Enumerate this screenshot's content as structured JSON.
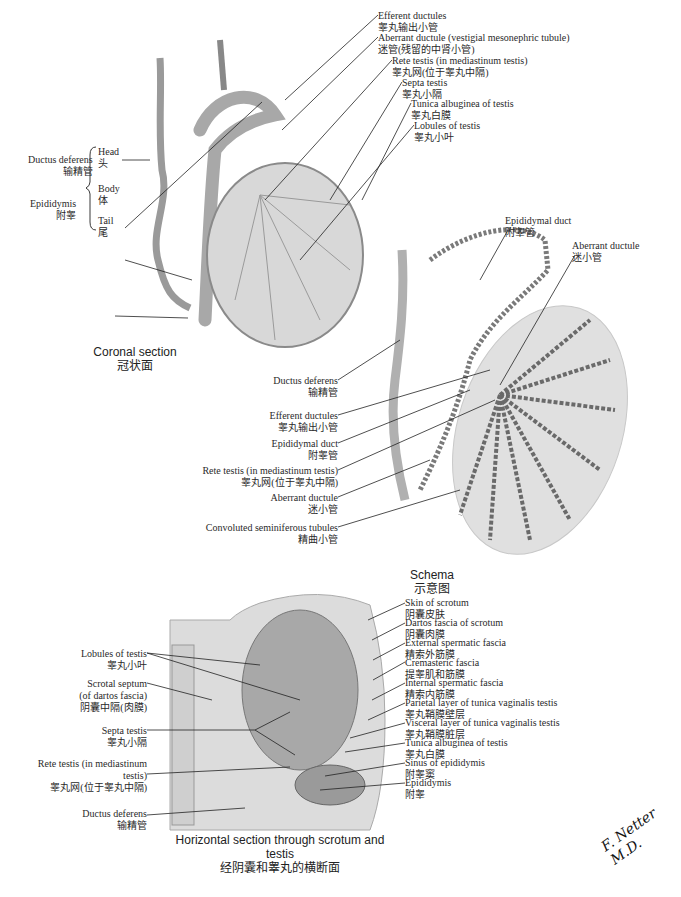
{
  "coronal": {
    "caption_en": "Coronal section",
    "caption_zh": "冠状面",
    "labels": {
      "ductus_deferens": {
        "en": "Ductus deferens",
        "zh": "输精管"
      },
      "epididymis": {
        "en": "Epididymis",
        "zh": "附睾"
      },
      "head": {
        "en": "Head",
        "zh": "头"
      },
      "body": {
        "en": "Body",
        "zh": "体"
      },
      "tail": {
        "en": "Tail",
        "zh": "尾"
      },
      "efferent_ductules": {
        "en": "Efferent ductules",
        "zh": "睾丸输出小管"
      },
      "aberrant_ductule": {
        "en": "Aberrant ductule (vestigial mesonephric tubule)",
        "zh": "迷管(残留的中肾小管)"
      },
      "rete_testis": {
        "en": "Rete testis (in mediastinum testis)",
        "zh": "睾丸网(位于睾丸中隔)"
      },
      "septa_testis": {
        "en": "Septa testis",
        "zh": "睾丸小隔"
      },
      "tunica_albuginea": {
        "en": "Tunica albuginea of testis",
        "zh": "睾丸白膜"
      },
      "lobules": {
        "en": "Lobules of testis",
        "zh": "睾丸小叶"
      }
    }
  },
  "schema": {
    "caption_en": "Schema",
    "caption_zh": "示意图",
    "labels": {
      "epididymal_duct_top": {
        "en": "Epididymal duct",
        "zh": "附睾管"
      },
      "aberrant_ductule_top": {
        "en": "Aberrant ductule",
        "zh": "迷小管"
      },
      "ductus_deferens": {
        "en": "Ductus deferens",
        "zh": "输精管"
      },
      "efferent_ductules": {
        "en": "Efferent ductules",
        "zh": "睾丸输出小管"
      },
      "epididymal_duct": {
        "en": "Epididymal duct",
        "zh": "附睾管"
      },
      "rete_testis": {
        "en": "Rete testis (in mediastinum testis)",
        "zh": "睾丸网(位于睾丸中隔)"
      },
      "aberrant_ductule": {
        "en": "Aberrant ductule",
        "zh": "迷小管"
      },
      "convoluted_tubules": {
        "en": "Convoluted seminiferous tubules",
        "zh": "精曲小管"
      }
    }
  },
  "horizontal": {
    "caption_en": "Horizontal section through scrotum and testis",
    "caption_zh": "经阴囊和睾丸的横断面",
    "left_labels": {
      "lobules": {
        "en": "Lobules of testis",
        "zh": "睾丸小叶"
      },
      "scrotal_septum": {
        "en1": "Scrotal septum",
        "en2": "(of dartos fascia)",
        "zh": "阴囊中隔(肉膜)"
      },
      "septa_testis": {
        "en": "Septa testis",
        "zh": "睾丸小隔"
      },
      "rete_testis": {
        "en1": "Rete testis (in mediastinum",
        "en2": "testis)",
        "zh": "睾丸网(位于睾丸中隔)"
      },
      "ductus_deferens": {
        "en": "Ductus deferens",
        "zh": "输精管"
      }
    },
    "right_labels": [
      {
        "en": "Skin of scrotum",
        "zh": "阴囊皮肤"
      },
      {
        "en": "Dartos fascia of scrotum",
        "zh": "阴囊肉膜"
      },
      {
        "en": "External spermatic fascia",
        "zh": "精索外筋膜"
      },
      {
        "en": "Cremasteric fascia",
        "zh": "提睾肌和筋膜"
      },
      {
        "en": "Internal spermatic fascia",
        "zh": "精索内筋膜"
      },
      {
        "en": "Parietal layer of tunica vaginalis testis",
        "zh": "睾丸鞘膜壁层"
      },
      {
        "en": "Visceral layer of tunica vaginalis testis",
        "zh": "睾丸鞘膜脏层"
      },
      {
        "en": "Tunica albuginea of testis",
        "zh": "睾丸白膜"
      },
      {
        "en": "Sinus of epididymis",
        "zh": "附睾窦"
      },
      {
        "en": "Epididymis",
        "zh": "附睾"
      }
    ]
  },
  "signature": "F. Netter M.D."
}
